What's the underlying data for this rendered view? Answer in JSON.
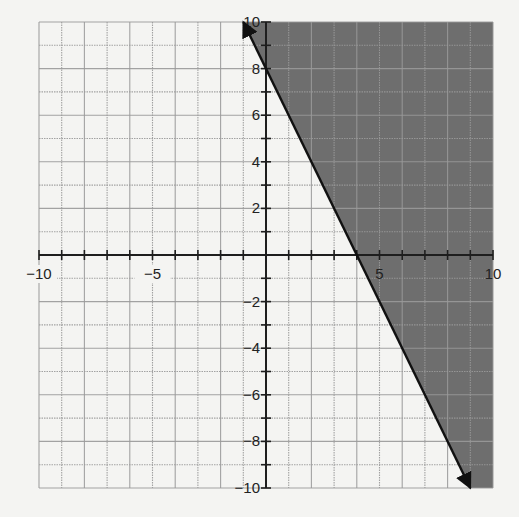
{
  "chart_data": {
    "type": "line",
    "title": "",
    "xlabel": "",
    "ylabel": "",
    "xlim": [
      -10,
      10
    ],
    "ylim": [
      -10,
      10
    ],
    "grid": true,
    "grid_step": 1,
    "x_tick_labels": [
      {
        "value": -10,
        "label": "−10"
      },
      {
        "value": -5,
        "label": "−5"
      },
      {
        "value": 5,
        "label": "5"
      },
      {
        "value": 10,
        "label": "10"
      }
    ],
    "y_tick_labels": [
      {
        "value": 10,
        "label": "10"
      },
      {
        "value": 8,
        "label": "8"
      },
      {
        "value": 6,
        "label": "6"
      },
      {
        "value": 4,
        "label": "4"
      },
      {
        "value": 2,
        "label": "2"
      },
      {
        "value": -2,
        "label": "−2"
      },
      {
        "value": -4,
        "label": "−4"
      },
      {
        "value": -6,
        "label": "−6"
      },
      {
        "value": -8,
        "label": "−8"
      },
      {
        "value": -10,
        "label": "−10"
      }
    ],
    "series": [
      {
        "name": "boundary line y = -2x + 8",
        "equation": "y = -2x + 8",
        "slope": -2,
        "y_intercept": 8,
        "x_intercept": 4,
        "points": [
          [
            -1,
            10
          ],
          [
            9,
            -10
          ]
        ],
        "style": "solid",
        "arrows": "both"
      }
    ],
    "shaded_region": {
      "inequality": "y >= -2x + 8",
      "side": "right/above line",
      "color": "#6e6e6e"
    }
  },
  "colors": {
    "background": "#f4f4f2",
    "grid": "#9a9a9a",
    "axis": "#1e1e1e",
    "shade": "#6e6e6e",
    "line": "#111111"
  }
}
